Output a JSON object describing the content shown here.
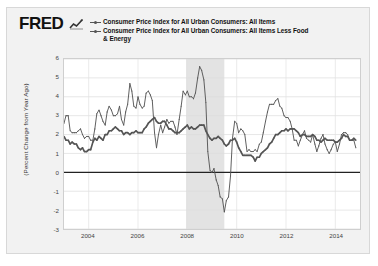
{
  "card": {
    "background_color": "#f2f2f2",
    "plot_background_color": "#ffffff",
    "recession_shade_color": "#e3e3e3",
    "series_color": "#555555"
  },
  "header": {
    "logo_text": "FRED",
    "logo_glyph_name": "fred-line-chart-glyph"
  },
  "legend": {
    "items": [
      {
        "label": "Consumer Price Index for All Urban Consumers: All Items"
      },
      {
        "label": "Consumer Price Index for All Urban Consumers: All Items Less Food"
      }
    ],
    "continuation": "& Energy"
  },
  "chart_data": {
    "type": "line",
    "title": "",
    "xlabel": "",
    "ylabel": "(Percent Change from Year Ago)",
    "xlim": [
      2003.0,
      2015.0
    ],
    "ylim": [
      -3,
      6
    ],
    "yticks": [
      6,
      5,
      4,
      3,
      2,
      1,
      0,
      -1,
      -2,
      -3
    ],
    "xticks": [
      2004,
      2006,
      2008,
      2010,
      2012,
      2014
    ],
    "grid": true,
    "zero_line": true,
    "legend_position": "top",
    "shaded_regions": [
      {
        "label": "recession",
        "start": 2007.95,
        "end": 2009.5
      }
    ],
    "series": [
      {
        "name": "Consumer Price Index for All Urban Consumers: All Items",
        "x": [
          2003.0,
          2003.08,
          2003.17,
          2003.25,
          2003.33,
          2003.42,
          2003.5,
          2003.58,
          2003.67,
          2003.75,
          2003.83,
          2003.92,
          2004.0,
          2004.08,
          2004.17,
          2004.25,
          2004.33,
          2004.42,
          2004.5,
          2004.58,
          2004.67,
          2004.75,
          2004.83,
          2004.92,
          2005.0,
          2005.08,
          2005.17,
          2005.25,
          2005.33,
          2005.42,
          2005.5,
          2005.58,
          2005.67,
          2005.75,
          2005.83,
          2005.92,
          2006.0,
          2006.08,
          2006.17,
          2006.25,
          2006.33,
          2006.42,
          2006.5,
          2006.58,
          2006.67,
          2006.75,
          2006.83,
          2006.92,
          2007.0,
          2007.08,
          2007.17,
          2007.25,
          2007.33,
          2007.42,
          2007.5,
          2007.58,
          2007.67,
          2007.75,
          2007.83,
          2007.92,
          2008.0,
          2008.08,
          2008.17,
          2008.25,
          2008.33,
          2008.42,
          2008.5,
          2008.58,
          2008.67,
          2008.75,
          2008.83,
          2008.92,
          2009.0,
          2009.08,
          2009.17,
          2009.25,
          2009.33,
          2009.42,
          2009.5,
          2009.58,
          2009.67,
          2009.75,
          2009.83,
          2009.92,
          2010.0,
          2010.08,
          2010.17,
          2010.25,
          2010.33,
          2010.42,
          2010.5,
          2010.58,
          2010.67,
          2010.75,
          2010.83,
          2010.92,
          2011.0,
          2011.08,
          2011.17,
          2011.25,
          2011.33,
          2011.42,
          2011.5,
          2011.58,
          2011.67,
          2011.75,
          2011.83,
          2011.92,
          2012.0,
          2012.08,
          2012.17,
          2012.25,
          2012.33,
          2012.42,
          2012.5,
          2012.58,
          2012.67,
          2012.75,
          2012.83,
          2012.92,
          2013.0,
          2013.08,
          2013.17,
          2013.25,
          2013.33,
          2013.42,
          2013.5,
          2013.58,
          2013.67,
          2013.75,
          2013.83,
          2013.92,
          2014.0,
          2014.08,
          2014.17,
          2014.25,
          2014.33,
          2014.42,
          2014.5,
          2014.58,
          2014.67,
          2014.75,
          2014.83
        ],
        "values": [
          2.6,
          3.0,
          3.0,
          2.2,
          2.1,
          2.1,
          2.1,
          2.2,
          2.3,
          2.0,
          1.8,
          1.9,
          1.9,
          1.7,
          1.7,
          2.3,
          3.1,
          3.3,
          3.0,
          2.7,
          2.5,
          3.2,
          3.5,
          3.3,
          3.0,
          3.0,
          3.1,
          3.5,
          2.8,
          2.5,
          3.2,
          3.6,
          4.7,
          4.3,
          3.5,
          3.4,
          4.0,
          3.6,
          3.4,
          3.5,
          4.2,
          4.3,
          4.1,
          3.8,
          2.1,
          1.3,
          2.0,
          2.5,
          2.1,
          2.4,
          2.8,
          2.6,
          2.7,
          2.7,
          2.4,
          2.0,
          2.8,
          3.5,
          4.3,
          4.1,
          4.3,
          4.0,
          4.0,
          3.9,
          4.2,
          5.0,
          5.6,
          5.4,
          4.9,
          3.7,
          1.1,
          0.1,
          0.0,
          0.2,
          -0.4,
          -0.7,
          -1.3,
          -1.4,
          -2.1,
          -1.5,
          -1.3,
          -0.2,
          1.8,
          2.7,
          2.6,
          2.1,
          2.3,
          2.2,
          2.0,
          1.1,
          1.2,
          1.1,
          1.1,
          1.2,
          1.1,
          1.5,
          1.6,
          2.1,
          2.7,
          3.2,
          3.6,
          3.6,
          3.6,
          3.8,
          3.9,
          3.5,
          3.4,
          3.0,
          2.9,
          2.9,
          2.7,
          2.3,
          1.7,
          1.7,
          1.4,
          1.7,
          2.0,
          2.2,
          1.8,
          1.7,
          1.6,
          2.0,
          1.5,
          1.1,
          1.4,
          1.8,
          2.0,
          1.5,
          1.2,
          1.0,
          1.2,
          1.5,
          1.6,
          1.1,
          1.5,
          2.0,
          2.1,
          2.1,
          2.0,
          1.7,
          1.7,
          1.7,
          1.3
        ]
      },
      {
        "name": "Consumer Price Index for All Urban Consumers: All Items Less Food & Energy",
        "x": [
          2003.0,
          2003.08,
          2003.17,
          2003.25,
          2003.33,
          2003.42,
          2003.5,
          2003.58,
          2003.67,
          2003.75,
          2003.83,
          2003.92,
          2004.0,
          2004.08,
          2004.17,
          2004.25,
          2004.33,
          2004.42,
          2004.5,
          2004.58,
          2004.67,
          2004.75,
          2004.83,
          2004.92,
          2005.0,
          2005.08,
          2005.17,
          2005.25,
          2005.33,
          2005.42,
          2005.5,
          2005.58,
          2005.67,
          2005.75,
          2005.83,
          2005.92,
          2006.0,
          2006.08,
          2006.17,
          2006.25,
          2006.33,
          2006.42,
          2006.5,
          2006.58,
          2006.67,
          2006.75,
          2006.83,
          2006.92,
          2007.0,
          2007.08,
          2007.17,
          2007.25,
          2007.33,
          2007.42,
          2007.5,
          2007.58,
          2007.67,
          2007.75,
          2007.83,
          2007.92,
          2008.0,
          2008.08,
          2008.17,
          2008.25,
          2008.33,
          2008.42,
          2008.5,
          2008.58,
          2008.67,
          2008.75,
          2008.83,
          2008.92,
          2009.0,
          2009.08,
          2009.17,
          2009.25,
          2009.33,
          2009.42,
          2009.5,
          2009.58,
          2009.67,
          2009.75,
          2009.83,
          2009.92,
          2010.0,
          2010.08,
          2010.17,
          2010.25,
          2010.33,
          2010.42,
          2010.5,
          2010.58,
          2010.67,
          2010.75,
          2010.83,
          2010.92,
          2011.0,
          2011.08,
          2011.17,
          2011.25,
          2011.33,
          2011.42,
          2011.5,
          2011.58,
          2011.67,
          2011.75,
          2011.83,
          2011.92,
          2012.0,
          2012.08,
          2012.17,
          2012.25,
          2012.33,
          2012.42,
          2012.5,
          2012.58,
          2012.67,
          2012.75,
          2012.83,
          2012.92,
          2013.0,
          2013.08,
          2013.17,
          2013.25,
          2013.33,
          2013.42,
          2013.5,
          2013.58,
          2013.67,
          2013.75,
          2013.83,
          2013.92,
          2014.0,
          2014.08,
          2014.17,
          2014.25,
          2014.33,
          2014.42,
          2014.5,
          2014.58,
          2014.67,
          2014.75,
          2014.83
        ],
        "values": [
          1.9,
          1.7,
          1.7,
          1.5,
          1.6,
          1.5,
          1.5,
          1.3,
          1.2,
          1.3,
          1.1,
          1.1,
          1.2,
          1.2,
          1.6,
          1.8,
          1.7,
          1.9,
          1.8,
          1.7,
          2.0,
          2.0,
          2.2,
          2.2,
          2.3,
          2.4,
          2.3,
          2.2,
          2.2,
          2.0,
          2.1,
          2.1,
          2.0,
          2.1,
          2.1,
          2.2,
          2.1,
          2.1,
          2.1,
          2.3,
          2.4,
          2.6,
          2.7,
          2.8,
          2.9,
          2.7,
          2.6,
          2.6,
          2.7,
          2.7,
          2.5,
          2.3,
          2.3,
          2.2,
          2.1,
          2.1,
          2.1,
          2.2,
          2.3,
          2.4,
          2.5,
          2.3,
          2.4,
          2.3,
          2.3,
          2.4,
          2.5,
          2.5,
          2.5,
          2.2,
          2.0,
          1.8,
          1.7,
          1.8,
          1.8,
          1.9,
          1.8,
          1.7,
          1.5,
          1.4,
          1.5,
          1.7,
          1.7,
          1.8,
          1.6,
          1.3,
          1.1,
          0.9,
          0.9,
          0.9,
          0.9,
          0.9,
          0.8,
          0.6,
          0.8,
          0.8,
          1.0,
          1.1,
          1.2,
          1.3,
          1.5,
          1.6,
          1.8,
          2.0,
          2.0,
          2.1,
          2.2,
          2.2,
          2.3,
          2.2,
          2.3,
          2.3,
          2.3,
          2.2,
          2.1,
          1.9,
          2.0,
          2.0,
          1.9,
          1.9,
          1.9,
          2.0,
          1.9,
          1.7,
          1.7,
          1.6,
          1.7,
          1.8,
          1.7,
          1.7,
          1.7,
          1.7,
          1.6,
          1.6,
          1.7,
          1.8,
          2.0,
          1.9,
          1.9,
          1.7,
          1.7,
          1.8,
          1.7
        ]
      }
    ]
  }
}
